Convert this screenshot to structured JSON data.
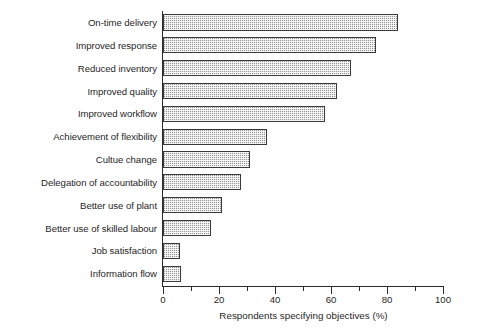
{
  "chart_data": {
    "type": "bar",
    "orientation": "horizontal",
    "title": "",
    "xlabel": "Respondents specifying objectives (%)",
    "ylabel": "",
    "xlim": [
      0,
      100
    ],
    "xticks": [
      0,
      20,
      40,
      60,
      80,
      100
    ],
    "xtick_labels": [
      "0",
      "20",
      "40",
      "60",
      "80",
      "100"
    ],
    "minor_xticks": [
      10,
      30,
      50,
      70,
      90
    ],
    "grid": false,
    "legend": null,
    "categories": [
      "On-time delivery",
      "Improved response",
      "Reduced inventory",
      "Improved quality",
      "Improved workflow",
      "Achievement of flexibility",
      "Cultue change",
      "Delegation of accountability",
      "Better use of plant",
      "Better use of skilled labour",
      "Job satisfaction",
      "Information flow"
    ],
    "values": [
      84,
      76,
      67,
      62,
      58,
      37,
      31,
      28,
      21,
      17,
      6,
      6.5
    ],
    "bar_fill_color": "#cdcdcd",
    "bar_edge_color": "#3a3a3a",
    "axis_color": "#2b2b2b",
    "background_color": "#ffffff"
  }
}
